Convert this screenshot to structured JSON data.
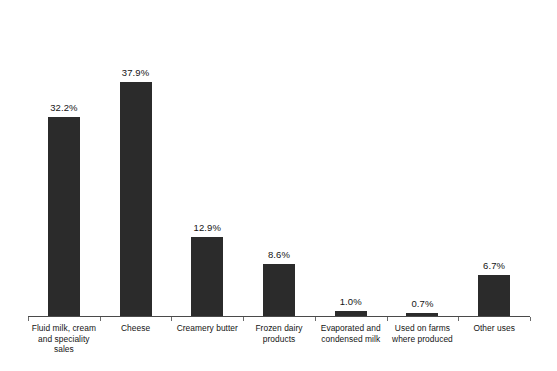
{
  "chart_data": {
    "type": "bar",
    "title": "",
    "subtitle": "",
    "xlabel": "",
    "ylabel": "",
    "ylim": [
      0,
      40
    ],
    "grid": false,
    "legend": "none",
    "orientation": "vertical",
    "value_label_format": "percent-one-decimal",
    "bar_color": "#2b2b2b",
    "axis_color": "#4a4a4a",
    "background_color": "#ffffff",
    "categories": [
      "Fluid milk, cream and speciality sales",
      "Cheese",
      "Creamery butter",
      "Frozen dairy products",
      "Evaporated and condensed milk",
      "Used on farms where produced",
      "Other uses"
    ],
    "category_lines": [
      [
        "Fluid milk, cream",
        "and speciality",
        "sales"
      ],
      [
        "Cheese"
      ],
      [
        "Creamery butter"
      ],
      [
        "Frozen dairy",
        "products"
      ],
      [
        "Evaporated and",
        "condensed milk"
      ],
      [
        "Used on farms",
        "where produced"
      ],
      [
        "Other uses"
      ]
    ],
    "values": [
      32.2,
      37.9,
      12.9,
      8.6,
      1.0,
      0.7,
      6.7
    ],
    "value_labels": [
      "32.2%",
      "37.9%",
      "12.9%",
      "8.6%",
      "1.0%",
      "0.7%",
      "6.7%"
    ]
  }
}
